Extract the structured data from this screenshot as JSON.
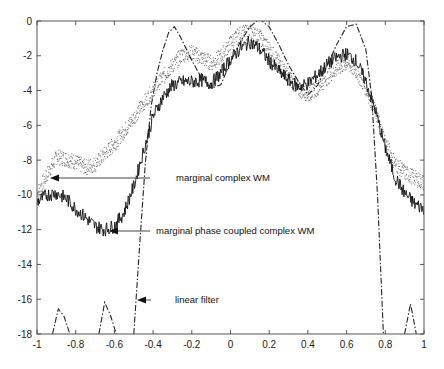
{
  "chart_data": {
    "type": "line",
    "title": "",
    "xlabel": "",
    "ylabel": "",
    "xlim": [
      -1,
      1
    ],
    "ylim": [
      -18,
      0
    ],
    "grid": false,
    "legend": "none (inline arrow annotations)",
    "x_ticks": [
      "-1",
      "-0.8",
      "-0.6",
      "-0.4",
      "-0.2",
      "0",
      "0.2",
      "0.4",
      "0.6",
      "0.8",
      "1"
    ],
    "y_ticks": [
      "0",
      "-2",
      "-4",
      "-6",
      "-8",
      "-10",
      "-12",
      "-14",
      "-16",
      "-18"
    ],
    "series": [
      {
        "name": "marginal complex WM",
        "style": "dotted (sparse points)",
        "x": [
          -1.0,
          -0.95,
          -0.9,
          -0.85,
          -0.8,
          -0.75,
          -0.7,
          -0.65,
          -0.6,
          -0.55,
          -0.5,
          -0.45,
          -0.4,
          -0.35,
          -0.3,
          -0.25,
          -0.2,
          -0.15,
          -0.1,
          -0.05,
          0.0,
          0.05,
          0.1,
          0.15,
          0.2,
          0.25,
          0.3,
          0.35,
          0.4,
          0.45,
          0.5,
          0.55,
          0.6,
          0.65,
          0.7,
          0.75,
          0.8,
          0.85,
          0.9,
          0.95,
          1.0
        ],
        "values": [
          -9.9,
          -8.8,
          -7.8,
          -7.9,
          -8.1,
          -8.4,
          -8.2,
          -7.6,
          -7.0,
          -6.3,
          -5.5,
          -4.7,
          -3.9,
          -3.2,
          -2.5,
          -1.9,
          -1.8,
          -2.1,
          -2.4,
          -2.0,
          -1.2,
          -0.7,
          -0.6,
          -0.9,
          -1.6,
          -2.4,
          -3.2,
          -3.9,
          -4.2,
          -3.8,
          -3.2,
          -2.7,
          -2.4,
          -2.9,
          -3.9,
          -5.3,
          -7.0,
          -8.2,
          -8.7,
          -9.0,
          -9.3
        ]
      },
      {
        "name": "marginal phase coupled complex WM",
        "style": "solid noisy",
        "x": [
          -1.0,
          -0.95,
          -0.9,
          -0.85,
          -0.8,
          -0.75,
          -0.7,
          -0.65,
          -0.6,
          -0.55,
          -0.5,
          -0.45,
          -0.4,
          -0.35,
          -0.3,
          -0.25,
          -0.2,
          -0.15,
          -0.1,
          -0.05,
          0.0,
          0.05,
          0.1,
          0.15,
          0.2,
          0.25,
          0.3,
          0.35,
          0.4,
          0.45,
          0.5,
          0.55,
          0.6,
          0.65,
          0.7,
          0.75,
          0.8,
          0.85,
          0.9,
          0.95,
          1.0
        ],
        "values": [
          -10.4,
          -10.0,
          -9.9,
          -10.2,
          -10.8,
          -11.3,
          -11.8,
          -12.0,
          -11.8,
          -11.0,
          -9.5,
          -7.5,
          -5.5,
          -4.4,
          -3.7,
          -3.5,
          -3.5,
          -3.4,
          -3.6,
          -3.0,
          -2.2,
          -1.6,
          -1.2,
          -1.6,
          -2.3,
          -2.9,
          -3.4,
          -3.8,
          -3.6,
          -3.1,
          -2.5,
          -2.1,
          -1.9,
          -2.3,
          -3.5,
          -5.2,
          -7.3,
          -9.0,
          -9.9,
          -10.5,
          -10.8
        ]
      },
      {
        "name": "linear filter",
        "style": "dash-dot",
        "x": [
          -0.92,
          -0.89,
          -0.86,
          -0.83,
          -0.68,
          -0.65,
          -0.62,
          -0.59,
          -0.5,
          -0.47,
          -0.44,
          -0.41,
          -0.38,
          -0.35,
          -0.32,
          -0.29,
          -0.26,
          -0.23,
          -0.2,
          -0.15,
          -0.1,
          -0.05,
          0.0,
          0.05,
          0.1,
          0.15,
          0.2,
          0.25,
          0.3,
          0.35,
          0.4,
          0.45,
          0.5,
          0.55,
          0.6,
          0.65,
          0.7,
          0.73,
          0.76,
          0.79,
          0.9,
          0.93,
          0.96
        ],
        "values": [
          -18.0,
          -16.4,
          -17.0,
          -18.0,
          -18.0,
          -16.2,
          -17.0,
          -18.0,
          -18.0,
          -13.0,
          -8.0,
          -5.0,
          -3.0,
          -1.6,
          -0.5,
          -0.3,
          -0.8,
          -1.6,
          -2.4,
          -3.3,
          -4.0,
          -3.6,
          -2.4,
          -1.2,
          -0.2,
          0.0,
          -0.4,
          -1.4,
          -2.6,
          -3.6,
          -4.2,
          -3.7,
          -2.6,
          -1.4,
          -0.4,
          -0.1,
          -1.5,
          -4.5,
          -10.0,
          -18.0,
          -18.0,
          -16.4,
          -18.0
        ]
      }
    ],
    "annotations": [
      {
        "text": "marginal complex WM",
        "arrow_tip": [
          -0.92,
          -8.9
        ],
        "text_pos": [
          -0.45,
          -8.9
        ]
      },
      {
        "text": "marginal phase coupled complex WM",
        "arrow_tip": [
          -0.62,
          -11.9
        ],
        "text_pos": [
          -0.55,
          -11.9
        ]
      },
      {
        "text": "linear filter",
        "arrow_tip": [
          -0.49,
          -16.0
        ],
        "text_pos": [
          -0.45,
          -16.0
        ]
      }
    ]
  },
  "labels": {
    "annot_complex": "marginal complex WM",
    "annot_phase": "marginal phase coupled complex WM",
    "annot_linear": "linear filter"
  },
  "colors": {
    "axis": "#555555",
    "series_complex": "#666666",
    "series_phase": "#111111",
    "series_linear": "#222222",
    "text": "#111111"
  }
}
